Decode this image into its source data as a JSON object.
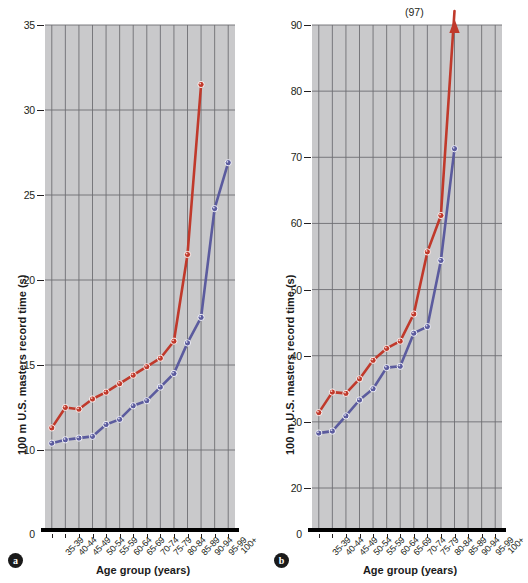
{
  "figure": {
    "panels": [
      {
        "letter": "a",
        "ylabel": "100 m U.S. masters record time (s)",
        "xlabel": "Age group (years)",
        "yticks": [
          "35",
          "30",
          "25",
          "20",
          "15",
          "10",
          "0"
        ],
        "annotation": ""
      },
      {
        "letter": "b",
        "ylabel": "100 m U.S. masters record time (s)",
        "xlabel": "Age group (years)",
        "yticks": [
          "90",
          "80",
          "70",
          "60",
          "50",
          "40",
          "30",
          "20",
          "0"
        ],
        "annotation": "(97)"
      }
    ]
  },
  "chart_data": [
    {
      "type": "line",
      "panel": "a",
      "title": "",
      "xlabel": "Age group (years)",
      "ylabel": "100 m U.S. masters record time (s)",
      "categories": [
        "35-39",
        "40-44",
        "45-49",
        "50-54",
        "55-59",
        "60-64",
        "65-69",
        "70-74",
        "75-79",
        "80-84",
        "85-89",
        "90-94",
        "95-99",
        "100+"
      ],
      "ylim": [
        10,
        35
      ],
      "ybreak": true,
      "yticks": [
        10,
        15,
        20,
        25,
        30,
        35
      ],
      "grid": true,
      "legend": "none",
      "series": [
        {
          "name": "women",
          "color": "#c0392b",
          "values": [
            11.3,
            12.5,
            12.4,
            13.0,
            13.4,
            13.9,
            14.4,
            14.9,
            15.4,
            16.4,
            21.5,
            31.5,
            null,
            null
          ]
        },
        {
          "name": "men",
          "color": "#5b5b9e",
          "values": [
            10.4,
            10.6,
            10.7,
            10.8,
            11.5,
            11.8,
            12.6,
            12.9,
            13.7,
            14.5,
            16.3,
            17.8,
            24.2,
            26.9
          ]
        }
      ]
    },
    {
      "type": "line",
      "panel": "b",
      "title": "",
      "xlabel": "Age group (years)",
      "ylabel": "100 m U.S. masters record time (s)",
      "categories": [
        "35-39",
        "40-44",
        "45-49",
        "50-54",
        "55-59",
        "60-64",
        "65-69",
        "70-74",
        "75-79",
        "80-84",
        "85-89",
        "90-94",
        "95-99",
        "100+"
      ],
      "ylim": [
        20,
        90
      ],
      "ybreak": true,
      "yticks": [
        20,
        30,
        40,
        50,
        60,
        70,
        80,
        90
      ],
      "grid": true,
      "legend": "none",
      "annotations": [
        {
          "text": "(97)",
          "category": "85-89",
          "value": 97,
          "arrow": true
        }
      ],
      "series": [
        {
          "name": "women",
          "color": "#c0392b",
          "values": [
            31.4,
            34.5,
            34.3,
            36.5,
            39.3,
            41.1,
            42.2,
            46.3,
            55.7,
            61.2,
            97.0,
            null,
            null,
            null
          ]
        },
        {
          "name": "men",
          "color": "#5b5b9e",
          "values": [
            28.3,
            28.6,
            30.9,
            33.3,
            35.0,
            38.2,
            38.4,
            43.4,
            44.4,
            54.4,
            71.3,
            null,
            null,
            null
          ]
        }
      ]
    }
  ]
}
